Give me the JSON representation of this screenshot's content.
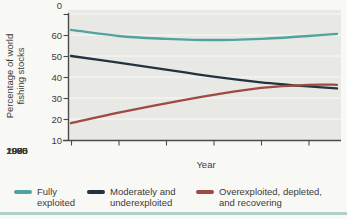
{
  "figure": {
    "background": "#f8f8f5",
    "plot_background": "#e8e8e4",
    "axis_color": "#4b4b49",
    "text_color": "#3b3b3b",
    "bottom_rule_color": "#64a5a2"
  },
  "chart_data": {
    "type": "line",
    "title": "",
    "xlabel": "Year",
    "ylabel": "Percentage of world fishing stocks",
    "ylabel_lines": [
      "Percentage of world",
      "fishing stocks"
    ],
    "xlim": [
      1975,
      2003
    ],
    "ylim": [
      0,
      60
    ],
    "grid": true,
    "legend_position": "bottom",
    "x": [
      1975,
      1980,
      1985,
      1990,
      1995,
      2000,
      2003
    ],
    "xticks": [
      1975,
      1980,
      1985,
      1990,
      1995,
      2000
    ],
    "yticks": [
      60,
      50,
      40,
      30,
      20,
      10,
      0
    ],
    "series": [
      {
        "name": "Fully exploited",
        "label_lines": [
          "Fully",
          "exploited"
        ],
        "color": "#52a3a0",
        "values": [
          52.5,
          49.5,
          48.2,
          47.6,
          48.2,
          49.5,
          50.5
        ]
      },
      {
        "name": "Moderately and underexploited",
        "label_lines": [
          "Moderately and",
          "underexploited"
        ],
        "color": "#22333f",
        "values": [
          40,
          36.8,
          33.5,
          30.2,
          27.5,
          25.5,
          24.5
        ]
      },
      {
        "name": "Overexploited, depleted, and recovering",
        "label_lines": [
          "Overexploited, depleted,",
          "and recovering"
        ],
        "color": "#9e4a41",
        "values": [
          8,
          13,
          17.5,
          21.5,
          24.8,
          26.3,
          26.3
        ]
      }
    ]
  }
}
